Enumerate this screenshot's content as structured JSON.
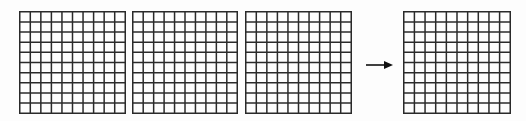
{
  "diagram": {
    "grids": [
      {
        "id": "grid-1",
        "rows": 10,
        "cols": 10,
        "x": 19,
        "y": 11,
        "w": 107,
        "h": 103
      },
      {
        "id": "grid-2",
        "rows": 10,
        "cols": 10,
        "x": 132,
        "y": 11,
        "w": 106,
        "h": 103
      },
      {
        "id": "grid-3",
        "rows": 10,
        "cols": 10,
        "x": 245,
        "y": 11,
        "w": 107,
        "h": 103
      },
      {
        "id": "grid-4",
        "rows": 10,
        "cols": 10,
        "x": 403,
        "y": 11,
        "w": 108,
        "h": 103
      }
    ],
    "arrow": {
      "from_x": 366,
      "to_x": 391,
      "y": 62,
      "direction": "right"
    },
    "colors": {
      "line": "#2a2a2a",
      "background": "#fdfdfd"
    }
  }
}
